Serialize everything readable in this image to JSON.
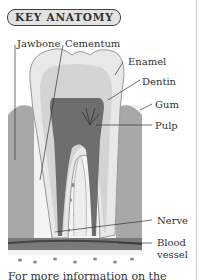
{
  "header": {
    "title": "KEY ANATOMY"
  },
  "diagram": {
    "labels": {
      "jawbone": "Jawbone",
      "cementum": "Cementum",
      "enamel": "Enamel",
      "dentin": "Dentin",
      "gum": "Gum",
      "pulp": "Pulp",
      "nerve": "Nerve",
      "blood_vessel_line1": "Blood",
      "blood_vessel_line2": "vessel"
    }
  },
  "caption": {
    "text": "For more information on the"
  }
}
